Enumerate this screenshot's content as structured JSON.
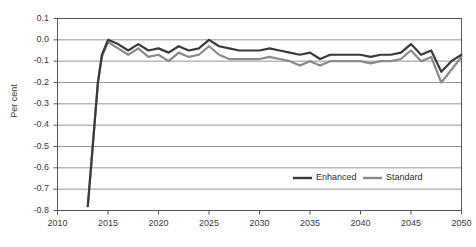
{
  "chart_data": {
    "type": "line",
    "title": "",
    "xlabel": "",
    "ylabel": "Per cent",
    "xlim": [
      2010,
      2050
    ],
    "ylim": [
      -0.8,
      0.1
    ],
    "y_ticks": [
      "0.1",
      "0.0",
      "-0.1",
      "-0.2",
      "-0.3",
      "-0.4",
      "-0.5",
      "-0.6",
      "-0.7",
      "-0.8"
    ],
    "y_tick_values": [
      0.1,
      0.0,
      -0.1,
      -0.2,
      -0.3,
      -0.4,
      -0.5,
      -0.6,
      -0.7,
      -0.8
    ],
    "x_ticks": [
      "2010",
      "2015",
      "2020",
      "2025",
      "2030",
      "2035",
      "2040",
      "2045",
      "2050"
    ],
    "x_tick_values": [
      2010,
      2015,
      2020,
      2025,
      2030,
      2035,
      2040,
      2045,
      2050
    ],
    "grid": "horizontal",
    "legend_position": "inside-bottom-right",
    "x": [
      2013,
      2013.4,
      2014,
      2014.4,
      2015,
      2016,
      2017,
      2018,
      2019,
      2020,
      2021,
      2022,
      2023,
      2024,
      2025,
      2026,
      2027,
      2028,
      2029,
      2030,
      2031,
      2032,
      2033,
      2034,
      2035,
      2036,
      2037,
      2038,
      2039,
      2040,
      2041,
      2042,
      2043,
      2044,
      2045,
      2046,
      2047,
      2048,
      2049,
      2050
    ],
    "series": [
      {
        "name": "Enhanced",
        "color": "#3a3a3a",
        "width": 2.2,
        "values": [
          -0.78,
          -0.55,
          -0.2,
          -0.07,
          0.0,
          -0.02,
          -0.05,
          -0.02,
          -0.05,
          -0.04,
          -0.06,
          -0.03,
          -0.05,
          -0.04,
          0.0,
          -0.03,
          -0.04,
          -0.05,
          -0.05,
          -0.05,
          -0.04,
          -0.05,
          -0.06,
          -0.07,
          -0.06,
          -0.09,
          -0.07,
          -0.07,
          -0.07,
          -0.07,
          -0.08,
          -0.07,
          -0.07,
          -0.06,
          -0.02,
          -0.07,
          -0.05,
          -0.15,
          -0.1,
          -0.07
        ]
      },
      {
        "name": "Standard",
        "color": "#8a8a8a",
        "width": 2.2,
        "values": [
          -0.78,
          -0.55,
          -0.2,
          -0.08,
          -0.01,
          -0.04,
          -0.07,
          -0.04,
          -0.08,
          -0.07,
          -0.1,
          -0.06,
          -0.08,
          -0.07,
          -0.03,
          -0.07,
          -0.09,
          -0.09,
          -0.09,
          -0.09,
          -0.08,
          -0.09,
          -0.1,
          -0.12,
          -0.1,
          -0.12,
          -0.1,
          -0.1,
          -0.1,
          -0.1,
          -0.11,
          -0.1,
          -0.1,
          -0.09,
          -0.05,
          -0.1,
          -0.08,
          -0.2,
          -0.14,
          -0.08
        ]
      }
    ],
    "legend": [
      {
        "label": "Enhanced",
        "color": "#3a3a3a"
      },
      {
        "label": "Standard",
        "color": "#8a8a8a"
      }
    ]
  },
  "colors": {
    "plot_background": "#ffffff",
    "grid_line": "#7a7a7a",
    "axis_line": "#555555",
    "tick_text": "#3a3a3a",
    "enhanced": "#3a3a3a",
    "standard": "#8a8a8a"
  }
}
